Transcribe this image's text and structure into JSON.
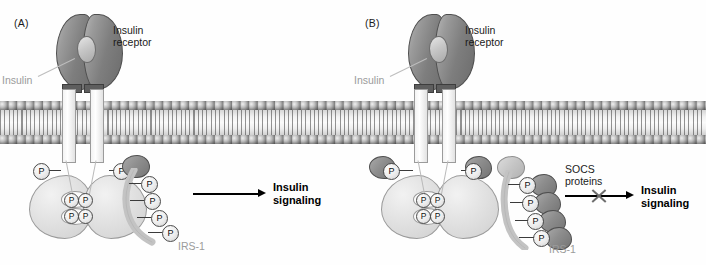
{
  "figure": {
    "panels": [
      {
        "id": "A",
        "label": "(A)",
        "labels": {
          "receptor": "Insulin\nreceptor",
          "receptor_line1": "Insulin",
          "receptor_line2": "receptor",
          "insulin": "Insulin",
          "irs1": "IRS-1",
          "outcome_line1": "Insulin",
          "outcome_line2": "signaling"
        },
        "phospho_symbol": "P",
        "receptor_phospho_count": 6,
        "irs1_phospho_count": 4,
        "socs_count": 0,
        "signaling_blocked": false
      },
      {
        "id": "B",
        "label": "(B)",
        "labels": {
          "receptor_line1": "Insulin",
          "receptor_line2": "receptor",
          "insulin": "Insulin",
          "irs1": "IRS-1",
          "socs_line1": "SOCS",
          "socs_line2": "proteins",
          "outcome_line1": "Insulin",
          "outcome_line2": "signaling"
        },
        "phospho_symbol": "P",
        "receptor_phospho_count": 6,
        "irs1_phospho_count": 4,
        "socs_count": 6,
        "signaling_blocked": true
      }
    ],
    "colors": {
      "receptor_alpha": "#7e7e7e",
      "kinase_domain": "#e2e2e2",
      "socs_protein": "#8d8d8d",
      "irs1_ribbon": "#c3c3c3",
      "membrane_head": "#6f6f6f",
      "label_grey": "#9b9b9b",
      "text_black": "#111111"
    }
  }
}
